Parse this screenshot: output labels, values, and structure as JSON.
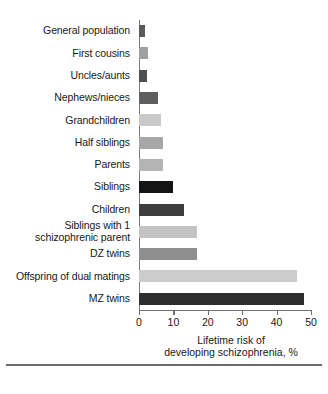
{
  "chart_data": {
    "type": "bar",
    "orientation": "horizontal",
    "title": "",
    "xlabel": "Lifetime risk of\ndeveloping schizophrenia, %",
    "ylabel": "",
    "xlim": [
      0,
      50
    ],
    "xticks": [
      0,
      10,
      20,
      30,
      40,
      50
    ],
    "xticklabels": [
      "0",
      "10",
      "20",
      "30",
      "40",
      "50"
    ],
    "grid": false,
    "legend": false,
    "categories": [
      "General population",
      "First cousins",
      "Uncles/aunts",
      "Nephews/nieces",
      "Grandchildren",
      "Half siblings",
      "Parents",
      "Siblings",
      "Children",
      "Siblings with 1\nschizophrenic parent",
      "DZ twins",
      "Offspring of dual matings",
      "MZ twins"
    ],
    "values": [
      1.7,
      2.6,
      2.4,
      5.5,
      6.5,
      7,
      7,
      10,
      13,
      17,
      17,
      46,
      48
    ],
    "bar_colors": [
      "#595959",
      "#a0a0a0",
      "#4f4f4f",
      "#5e5e5e",
      "#c9c9c9",
      "#a6a6a6",
      "#b4b4b4",
      "#151515",
      "#3d3d3d",
      "#c4c4c4",
      "#8f8f8f",
      "#cccccc",
      "#2e2e2e"
    ]
  },
  "colors": {
    "axis": "#6f6f6f",
    "text": "#181818",
    "background": "#ffffff",
    "rule": "#6b6b6b"
  }
}
